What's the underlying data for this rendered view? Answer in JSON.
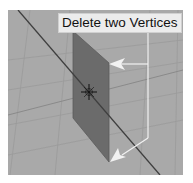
{
  "viewport": {
    "background": "#a9a9a9",
    "grid_color": "#9c9c9c",
    "axis_color": "#4a4a4a",
    "plane_color": "#6b6b6b"
  },
  "annotation": {
    "text": "Delete two Vertices",
    "arrow_color": "#f2f2f2",
    "arrows": [
      "arrow-upper-vertex",
      "arrow-lower-vertex"
    ]
  },
  "cursor": {
    "icon": "3d-cursor-icon"
  }
}
